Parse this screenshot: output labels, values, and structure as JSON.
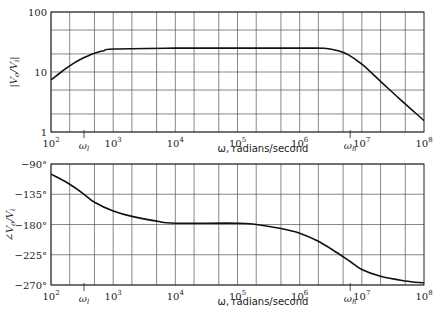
{
  "chart_data": [
    {
      "type": "line",
      "title": "",
      "xlabel": "ω, radians/second",
      "ylabel": "|V_o/V_i|",
      "x_scale": "log",
      "y_scale": "log",
      "xlim": [
        100,
        100000000
      ],
      "ylim": [
        1,
        100
      ],
      "x_ticks": [
        {
          "value": 100,
          "base": "10",
          "exp": "2"
        },
        {
          "value": 1000,
          "base": "10",
          "exp": "3"
        },
        {
          "value": 10000,
          "base": "10",
          "exp": "4"
        },
        {
          "value": 100000,
          "base": "10",
          "exp": "5"
        },
        {
          "value": 1000000,
          "base": "10",
          "exp": "6"
        },
        {
          "value": 10000000,
          "base": "10",
          "exp": "7"
        },
        {
          "value": 100000000,
          "base": "10",
          "exp": "8"
        }
      ],
      "y_ticks": [
        {
          "value": 1,
          "label": "1"
        },
        {
          "value": 10,
          "label": "10"
        },
        {
          "value": 100,
          "label": "100"
        }
      ],
      "grid": true,
      "x_grid_multipliers": [
        1,
        2,
        5
      ],
      "y_grid_values": [
        1,
        2,
        5,
        10,
        20,
        50,
        100
      ],
      "annotations": [
        {
          "label": "ω_l",
          "x": 340
        },
        {
          "label": "ω_h",
          "x": 6500000
        }
      ],
      "series": [
        {
          "name": "|V_o/V_i|",
          "x": [
            100,
            150,
            200,
            300,
            400,
            500,
            700,
            1000,
            10000,
            100000,
            1000000,
            2500000,
            4000000,
            6000000,
            10000000,
            20000000,
            40000000,
            100000000
          ],
          "y": [
            7.4,
            10.2,
            12.7,
            16.3,
            18.7,
            20.5,
            22.6,
            24.2,
            25,
            25,
            25,
            24.8,
            22.8,
            19.5,
            13.5,
            7.0,
            3.6,
            1.55
          ]
        }
      ]
    },
    {
      "type": "line",
      "title": "",
      "xlabel": "ω, radians/second",
      "ylabel": "∠V_o/V_i",
      "x_scale": "log",
      "y_scale": "linear",
      "xlim": [
        100,
        100000000
      ],
      "ylim": [
        -270,
        -90
      ],
      "x_ticks": [
        {
          "value": 100,
          "base": "10",
          "exp": "2"
        },
        {
          "value": 1000,
          "base": "10",
          "exp": "3"
        },
        {
          "value": 10000,
          "base": "10",
          "exp": "4"
        },
        {
          "value": 100000,
          "base": "10",
          "exp": "5"
        },
        {
          "value": 1000000,
          "base": "10",
          "exp": "6"
        },
        {
          "value": 10000000,
          "base": "10",
          "exp": "7"
        },
        {
          "value": 100000000,
          "base": "10",
          "exp": "8"
        }
      ],
      "y_ticks": [
        {
          "value": -90,
          "label": "−90°"
        },
        {
          "value": -135,
          "label": "−135°"
        },
        {
          "value": -180,
          "label": "−180°"
        },
        {
          "value": -225,
          "label": "−225°"
        },
        {
          "value": -270,
          "label": "−270°"
        }
      ],
      "grid": true,
      "x_grid_multipliers": [
        1,
        2,
        5
      ],
      "annotations": [
        {
          "label": "ω_l",
          "x": 340
        },
        {
          "label": "ω_h",
          "x": 6500000
        }
      ],
      "series": [
        {
          "name": "∠V_o/V_i",
          "x": [
            100,
            200,
            340,
            500,
            1000,
            2000,
            5000,
            10000,
            100000,
            200000,
            500000,
            1000000,
            2000000,
            4000000,
            6500000,
            10000000,
            20000000,
            50000000,
            100000000
          ],
          "y": [
            -105,
            -120,
            -135,
            -147,
            -160,
            -168,
            -175,
            -178,
            -178,
            -180,
            -186,
            -193,
            -205,
            -222,
            -235,
            -247,
            -257,
            -264,
            -267
          ]
        }
      ]
    }
  ]
}
